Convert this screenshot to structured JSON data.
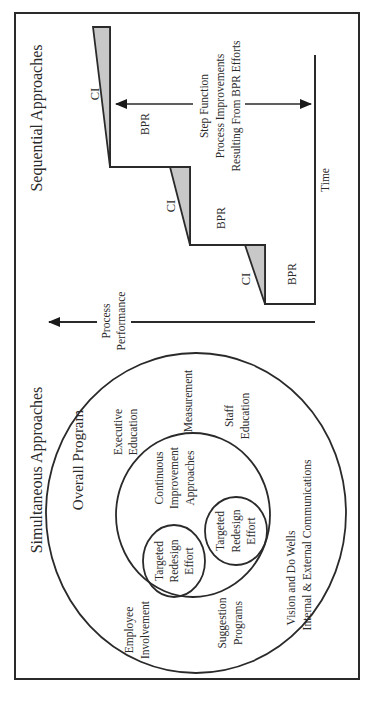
{
  "sequential": {
    "title": "Sequential Approaches",
    "axis_y_label_line1": "Process",
    "axis_y_label_line2": "Performance",
    "axis_x_label": "Time",
    "steps": [
      {
        "ci": "CI",
        "bpr": "BPR"
      },
      {
        "ci": "CI",
        "bpr": "BPR"
      },
      {
        "ci": "CI",
        "bpr": "BPR"
      }
    ],
    "annotation": {
      "line1": "Step Function",
      "line2": "Process Improvements",
      "line3": "Resulting From BPR Efforts"
    }
  },
  "simultaneous": {
    "title": "Simultaneous Approaches",
    "outer_circle_label": "Overall Program",
    "outer_items": {
      "executive_education_1": "Executive",
      "executive_education_2": "Education",
      "measurement": "Measurement",
      "staff_education_1": "Staff",
      "staff_education_2": "Education",
      "employee_involvement_1": "Employee",
      "employee_involvement_2": "Involvement",
      "suggestion_programs_1": "Suggestion",
      "suggestion_programs_2": "Programs",
      "vision_1": "Vision and Do Wells",
      "vision_2": "Internal & External Communications"
    },
    "inner_circle": {
      "line1": "Continuous",
      "line2": "Improvement",
      "line3": "Approaches"
    },
    "targeted_efforts": [
      {
        "line1": "Targeted",
        "line2": "Redesign",
        "line3": "Effort"
      },
      {
        "line1": "Targeted",
        "line2": "Redesign",
        "line3": "Effort"
      }
    ]
  }
}
